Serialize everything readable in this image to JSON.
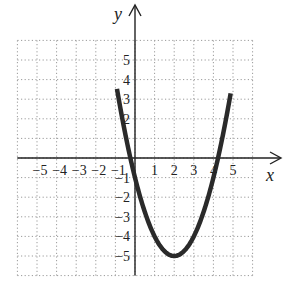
{
  "chart_data": {
    "type": "line",
    "title": "",
    "xlabel": "x",
    "ylabel": "y",
    "xlim": [
      -6,
      6
    ],
    "ylim": [
      -6,
      6
    ],
    "grid": true,
    "grid_style": "dotted",
    "x_ticks": [
      "-5",
      "-4",
      "-3",
      "-2",
      "-1",
      "1",
      "2",
      "3",
      "4",
      "5"
    ],
    "y_ticks": [
      "5",
      "4",
      "3",
      "2",
      "-1",
      "-2",
      "-3",
      "-4",
      "-5"
    ],
    "series": [
      {
        "name": "y = (x - 2)^2 - 5",
        "equation": "y = x^2 - 4x - 1",
        "vertex": [
          2,
          -5
        ],
        "x_intercepts": [
          -0.24,
          4.24
        ],
        "y_intercept": -1,
        "x": [
          -0.9,
          -0.5,
          0,
          0.5,
          1,
          1.5,
          2,
          2.5,
          3,
          3.5,
          4,
          4.5,
          4.9
        ],
        "values": [
          3.41,
          1.25,
          -1,
          -2.75,
          -4,
          -4.75,
          -5,
          -4.75,
          -4,
          -2.75,
          -1,
          1.25,
          3.41
        ],
        "color": "#2a2a2a"
      }
    ]
  },
  "labels": {
    "x_axis": "x",
    "y_axis": "y",
    "x_tick_text": [
      "−5",
      "−4",
      "−3",
      "−2",
      "−1",
      "1",
      "2",
      "3",
      "4",
      "5"
    ],
    "y_tick_text_pos": [
      "5",
      "4",
      "3",
      "2"
    ],
    "y_tick_text_neg": [
      "−1",
      "−2",
      "−3",
      "−4",
      "−5"
    ]
  }
}
